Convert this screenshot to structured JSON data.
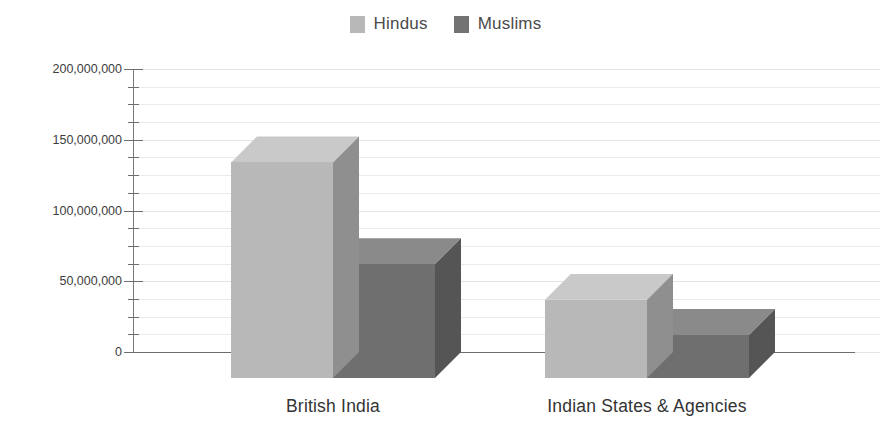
{
  "chart_data": {
    "type": "bar",
    "title": "",
    "subtitle": "",
    "xlabel": "",
    "ylabel": "",
    "categories": [
      "British India",
      "Indian States & Agencies"
    ],
    "series": [
      {
        "name": "Hindus",
        "values": [
          134000000,
          37000000
        ],
        "color": "#b8b8b8"
      },
      {
        "name": "Muslims",
        "values": [
          62000000,
          12000000
        ],
        "color": "#737373"
      }
    ],
    "ylim": [
      0,
      200000000
    ],
    "ytick_labels": [
      "0",
      "50,000,000",
      "100,000,000",
      "150,000,000",
      "200,000,000"
    ],
    "ytick_values": [
      0,
      50000000,
      100000000,
      150000000,
      200000000
    ],
    "minor_tick_step": 12500000,
    "grid": true,
    "grid_axis": "y",
    "legend_position": "top-center",
    "three_d": true
  },
  "legend": {
    "items": [
      {
        "label": "Hindus",
        "color": "#b8b8b8"
      },
      {
        "label": "Muslims",
        "color": "#737373"
      }
    ]
  },
  "axes": {
    "y": {
      "ticks": [
        {
          "label": "200,000,000",
          "value": 200000000
        },
        {
          "label": "150,000,000",
          "value": 150000000
        },
        {
          "label": "100,000,000",
          "value": 100000000
        },
        {
          "label": "50,000,000",
          "value": 50000000
        },
        {
          "label": "0",
          "value": 0
        }
      ]
    },
    "x": {
      "categories": [
        {
          "label": "British India"
        },
        {
          "label": "Indian States & Agencies"
        }
      ]
    }
  },
  "colors": {
    "hindus_front": "#b8b8b8",
    "hindus_top": "#c9c9c9",
    "hindus_side": "#8f8f8f",
    "muslims_front": "#6f6f6f",
    "muslims_top": "#8a8a8a",
    "muslims_side": "#555555",
    "axis": "#6e6e6e",
    "grid": "#e9eaec",
    "text": "#3d3d3d"
  }
}
